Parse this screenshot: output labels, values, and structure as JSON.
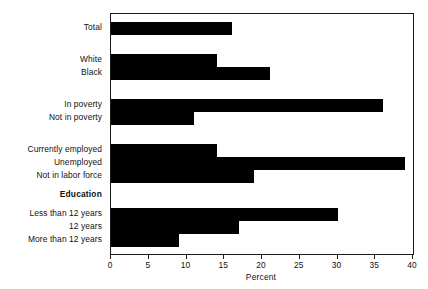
{
  "chart_data": {
    "type": "bar",
    "orientation": "horizontal",
    "title": "",
    "xlabel": "Percent",
    "ylabel": "",
    "xlim": [
      0,
      40
    ],
    "xticks": [
      0,
      5,
      10,
      15,
      20,
      25,
      30,
      35,
      40
    ],
    "xtick_labels": [
      "0",
      "5",
      "10",
      "15",
      "20",
      "25",
      "30",
      "35",
      "40"
    ],
    "grid": false,
    "legend": null,
    "bar_color": "#000000",
    "frame_color": "#1a1a1a",
    "categories": [
      "Total",
      "White",
      "Black",
      "In poverty",
      "Not in poverty",
      "Currently employed",
      "Unemployed",
      "Not in labor force",
      "Education",
      "Less than 12 years",
      "12 years",
      "More than 12 years"
    ],
    "values": [
      16,
      14,
      21,
      36,
      11,
      14,
      39,
      19,
      null,
      30,
      17,
      9
    ],
    "groups": [
      {
        "name": "",
        "items": [
          {
            "label": "Total",
            "value": 16
          }
        ]
      },
      {
        "name": "",
        "items": [
          {
            "label": "White",
            "value": 14
          },
          {
            "label": "Black",
            "value": 21
          }
        ]
      },
      {
        "name": "",
        "items": [
          {
            "label": "In poverty",
            "value": 36
          },
          {
            "label": "Not in poverty",
            "value": 11
          }
        ]
      },
      {
        "name": "",
        "items": [
          {
            "label": "Currently employed",
            "value": 14
          },
          {
            "label": "Unemployed",
            "value": 39
          },
          {
            "label": "Not in labor force",
            "value": 19
          }
        ]
      },
      {
        "name": "Education",
        "items": [
          {
            "label": "Less than 12 years",
            "value": 30
          },
          {
            "label": "12 years",
            "value": 17
          },
          {
            "label": "More than 12 years",
            "value": 9
          }
        ]
      }
    ]
  },
  "rows": [
    {
      "label": "Total",
      "value": 16,
      "header": false,
      "top": 8
    },
    {
      "label": "White",
      "value": 14,
      "header": false,
      "top": 40
    },
    {
      "label": "Black",
      "value": 21,
      "header": false,
      "top": 53
    },
    {
      "label": "In poverty",
      "value": 36,
      "header": false,
      "top": 85
    },
    {
      "label": "Not in poverty",
      "value": 11,
      "header": false,
      "top": 98
    },
    {
      "label": "Currently employed",
      "value": 14,
      "header": false,
      "top": 130
    },
    {
      "label": "Unemployed",
      "value": 39,
      "header": false,
      "top": 143
    },
    {
      "label": "Not in labor force",
      "value": 19,
      "header": false,
      "top": 156
    },
    {
      "label": "Education",
      "value": null,
      "header": true,
      "top": 175
    },
    {
      "label": "Less than 12 years",
      "value": 30,
      "header": false,
      "top": 194
    },
    {
      "label": "12 years",
      "value": 17,
      "header": false,
      "top": 207
    },
    {
      "label": "More than 12 years",
      "value": 9,
      "header": false,
      "top": 220
    }
  ]
}
